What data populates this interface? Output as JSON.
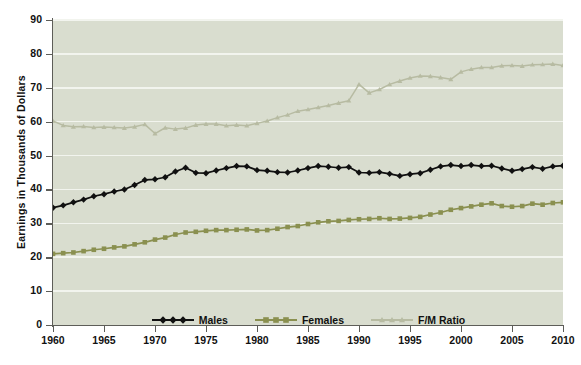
{
  "chart_data": {
    "type": "line",
    "title": "",
    "xlabel": "",
    "ylabel": "Earnings in Thousands of Dollars",
    "xlim": [
      1960,
      2010
    ],
    "ylim": [
      0,
      90
    ],
    "xticks": [
      1960,
      1965,
      1970,
      1975,
      1980,
      1985,
      1990,
      1995,
      2000,
      2005,
      2010
    ],
    "yticks": [
      0,
      10,
      20,
      30,
      40,
      50,
      60,
      70,
      80,
      90
    ],
    "grid": "horizontal",
    "legend_position": "bottom-center",
    "plot_background": "#d9ddcf",
    "x": [
      1960,
      1961,
      1962,
      1963,
      1964,
      1965,
      1966,
      1967,
      1968,
      1969,
      1970,
      1971,
      1972,
      1973,
      1974,
      1975,
      1976,
      1977,
      1978,
      1979,
      1980,
      1981,
      1982,
      1983,
      1984,
      1985,
      1986,
      1987,
      1988,
      1989,
      1990,
      1991,
      1992,
      1993,
      1994,
      1995,
      1996,
      1997,
      1998,
      1999,
      2000,
      2001,
      2002,
      2003,
      2004,
      2005,
      2006,
      2007,
      2008,
      2009,
      2010
    ],
    "series": [
      {
        "name": "Males",
        "color": "#101010",
        "marker": "diamond",
        "values": [
          34.6,
          35.3,
          36.2,
          37.0,
          38.0,
          38.6,
          39.4,
          40.0,
          41.3,
          42.8,
          43.0,
          43.6,
          45.3,
          46.4,
          44.9,
          44.8,
          45.6,
          46.3,
          46.9,
          46.8,
          45.7,
          45.5,
          45.1,
          45.0,
          45.6,
          46.3,
          46.9,
          46.7,
          46.4,
          46.6,
          45.0,
          44.9,
          45.1,
          44.6,
          44.0,
          44.5,
          44.8,
          45.8,
          46.8,
          47.2,
          46.9,
          47.2,
          46.9,
          47.0,
          46.2,
          45.5,
          46.0,
          46.6,
          46.1,
          46.8,
          47.0
        ]
      },
      {
        "name": "Females",
        "color": "#8a9050",
        "marker": "square",
        "values": [
          21.0,
          21.2,
          21.4,
          21.8,
          22.2,
          22.5,
          22.9,
          23.2,
          23.8,
          24.4,
          25.2,
          25.8,
          26.7,
          27.3,
          27.5,
          27.8,
          28.0,
          28.0,
          28.1,
          28.2,
          27.9,
          28.0,
          28.4,
          28.9,
          29.2,
          29.8,
          30.3,
          30.6,
          30.7,
          31.0,
          31.2,
          31.3,
          31.5,
          31.3,
          31.4,
          31.6,
          31.9,
          32.6,
          33.2,
          34.0,
          34.5,
          35.0,
          35.5,
          35.9,
          35.1,
          34.9,
          35.1,
          35.8,
          35.5,
          36.0,
          36.2
        ]
      },
      {
        "name": "F/M Ratio",
        "color": "#b7bba2",
        "marker": "triangle",
        "values": [
          60.2,
          58.9,
          58.5,
          58.6,
          58.3,
          58.4,
          58.3,
          58.1,
          58.5,
          59.2,
          56.5,
          58.2,
          57.8,
          58.1,
          59.0,
          59.3,
          59.3,
          58.8,
          59.0,
          58.8,
          59.5,
          60.2,
          61.2,
          62.0,
          63.1,
          63.6,
          64.2,
          64.8,
          65.5,
          66.2,
          71.0,
          68.5,
          69.5,
          71.0,
          72.0,
          72.9,
          73.5,
          73.4,
          73.0,
          72.5,
          74.7,
          75.5,
          76.0,
          76.0,
          76.5,
          76.6,
          76.4,
          76.8,
          76.9,
          77.0,
          76.6
        ]
      }
    ]
  },
  "legend": {
    "items": [
      {
        "label": "Males",
        "color": "#101010",
        "marker": "diamond"
      },
      {
        "label": "Females",
        "color": "#8a9050",
        "marker": "square"
      },
      {
        "label": "F/M Ratio",
        "color": "#b7bba2",
        "marker": "triangle"
      }
    ]
  },
  "axes": {
    "y_title": "Earnings in Thousands of Dollars",
    "y_tick_labels": [
      "0",
      "10",
      "20",
      "30",
      "40",
      "50",
      "60",
      "70",
      "80",
      "90"
    ],
    "x_tick_labels": [
      "1960",
      "1965",
      "1970",
      "1975",
      "1980",
      "1985",
      "1990",
      "1995",
      "2000",
      "2005",
      "2010"
    ]
  }
}
